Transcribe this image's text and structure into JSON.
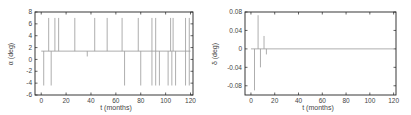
{
  "chart_data": [
    {
      "type": "line",
      "title": "",
      "xlabel": "t (months)",
      "ylabel": "α (deg)",
      "xlim": [
        -5,
        122
      ],
      "ylim": [
        -6,
        8
      ],
      "xticks": [
        0,
        20,
        40,
        60,
        80,
        100,
        120
      ],
      "yticks": [
        -6,
        -4,
        -2,
        0,
        2,
        4,
        6,
        8
      ],
      "grid": false,
      "legend": null,
      "baseline": 1.4,
      "series": [
        {
          "name": "alpha",
          "color": "#999999",
          "description": "Baseline near 1.4 deg with vertical spikes up to ~7 and down to ~-4.4",
          "spikes_up": [
            {
              "t": 6,
              "value": 7
            },
            {
              "t": 11,
              "value": 7
            },
            {
              "t": 14,
              "value": 7
            },
            {
              "t": 27,
              "value": 7
            },
            {
              "t": 43,
              "value": 7
            },
            {
              "t": 53,
              "value": 7
            },
            {
              "t": 65,
              "value": 7
            },
            {
              "t": 78,
              "value": 7
            },
            {
              "t": 89,
              "value": 7
            },
            {
              "t": 92,
              "value": 7
            },
            {
              "t": 104,
              "value": 7
            },
            {
              "t": 106,
              "value": 7
            },
            {
              "t": 116,
              "value": 7
            },
            {
              "t": 119,
              "value": 7
            }
          ],
          "spikes_down": [
            {
              "t": 2,
              "value": -4.4
            },
            {
              "t": 8,
              "value": -4.4
            },
            {
              "t": 37,
              "value": 0.5
            },
            {
              "t": 67,
              "value": -4.4
            },
            {
              "t": 80,
              "value": -4.4
            },
            {
              "t": 89,
              "value": -4.4
            },
            {
              "t": 92,
              "value": -4.4
            },
            {
              "t": 95,
              "value": -4.4
            },
            {
              "t": 102,
              "value": -4.4
            },
            {
              "t": 105,
              "value": -4.4
            },
            {
              "t": 108,
              "value": -4.4
            },
            {
              "t": 116,
              "value": -4.4
            },
            {
              "t": 119,
              "value": -4.4
            }
          ]
        }
      ]
    },
    {
      "type": "line",
      "title": "",
      "xlabel": "t (months)",
      "ylabel": "δ (deg)",
      "xlim": [
        -5,
        122
      ],
      "ylim": [
        -0.1,
        0.08
      ],
      "xticks": [
        0,
        20,
        40,
        60,
        80,
        100,
        120
      ],
      "yticks": [
        -0.08,
        -0.04,
        0,
        0.04,
        0.08
      ],
      "grid": false,
      "legend": null,
      "baseline": 0,
      "series": [
        {
          "name": "delta",
          "color": "#999999",
          "description": "Damped spikes at start then flat at zero",
          "spikes": [
            {
              "t": 3,
              "value": -0.09
            },
            {
              "t": 6,
              "value": 0.073
            },
            {
              "t": 8,
              "value": -0.04
            },
            {
              "t": 11,
              "value": 0.028
            },
            {
              "t": 13,
              "value": -0.012
            }
          ]
        }
      ]
    }
  ],
  "left": {
    "ylabel": "α (deg)",
    "xlabel": "t (months)",
    "yticks": [
      "8",
      "6",
      "4",
      "2",
      "0",
      "-2",
      "-4",
      "-6"
    ],
    "xticks": [
      "0",
      "20",
      "40",
      "60",
      "80",
      "100",
      "120"
    ]
  },
  "right": {
    "ylabel": "δ (deg)",
    "xlabel": "t (months)",
    "yticks": [
      "0.08",
      "0.04",
      "0",
      "-0.04",
      "-0.08"
    ],
    "xticks": [
      "0",
      "20",
      "40",
      "60",
      "80",
      "100",
      "120"
    ]
  }
}
